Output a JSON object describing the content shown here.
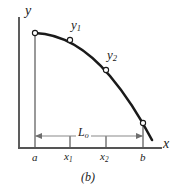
{
  "figure": {
    "caption": "(b)",
    "background_color": "#ffffff",
    "curve_color": "#1a1a1a",
    "axis_color": "#555555",
    "dimension_color": "#8a8a8a",
    "marker_fill": "#ffffff"
  },
  "axes": {
    "y_label": "y",
    "x_label": "x",
    "y_axis": {
      "x": 19,
      "y_top": 18,
      "y_bottom": 148
    },
    "x_axis": {
      "y": 148,
      "x_left": 19,
      "x_right": 161
    }
  },
  "ticks": [
    {
      "name": "a",
      "label": "a",
      "sub": "",
      "x": 35,
      "has_axis_tick": false
    },
    {
      "name": "x1",
      "label": "x",
      "sub": "1",
      "x": 70,
      "has_axis_tick": true
    },
    {
      "name": "x2",
      "label": "x",
      "sub": "2",
      "x": 106,
      "has_axis_tick": true
    },
    {
      "name": "b",
      "label": "b",
      "sub": "",
      "x": 143,
      "has_axis_tick": false
    }
  ],
  "curve": {
    "path": "M 35 33 C 62 34 88 50 110 76 C 126 95 141 119 152 140",
    "stroke_width": 2.6,
    "markers": [
      {
        "name": "point-a",
        "x": 35,
        "y": 33,
        "r": 2.6
      },
      {
        "name": "point-x1",
        "x": 70,
        "y": 40,
        "r": 2.6
      },
      {
        "name": "point-x2",
        "x": 106,
        "y": 70,
        "r": 2.6
      },
      {
        "name": "point-b",
        "x": 143,
        "y": 123,
        "r": 2.6
      }
    ],
    "labels": [
      {
        "name": "y1",
        "text": "y",
        "sub": "1"
      },
      {
        "name": "y2",
        "text": "y",
        "sub": "2"
      }
    ]
  },
  "extension_lines": [
    {
      "name": "extension-line-a",
      "x": 35,
      "y_top": 33,
      "y_bottom": 148
    },
    {
      "name": "extension-line-b",
      "x": 143,
      "y_top": 123,
      "y_bottom": 148
    }
  ],
  "axis_ticks": [
    {
      "name": "axis-tick-x1",
      "x": 70,
      "y_top": 136,
      "y_bottom": 148
    },
    {
      "name": "axis-tick-x2",
      "x": 106,
      "y_top": 136,
      "y_bottom": 148
    }
  ],
  "dimension": {
    "label": "L",
    "sub": "o",
    "full_label": "Lo",
    "y": 136,
    "x_start": 35,
    "x_end": 143,
    "arrow_size": 5
  }
}
